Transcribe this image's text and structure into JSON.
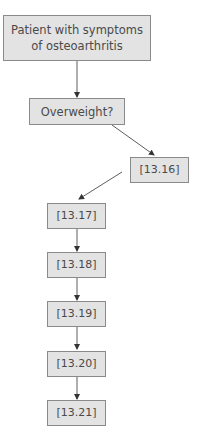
{
  "diagram": {
    "type": "flowchart",
    "colors": {
      "node_fill": "#e3e3e3",
      "node_border": "#8a8a8a",
      "text": "#4a4a4a",
      "edge": "#333333"
    },
    "nodes": [
      {
        "id": "n1",
        "label": "Patient with symptoms of osteoarthritis",
        "line1": "Patient with symptoms",
        "line2": "of osteoarthritis"
      },
      {
        "id": "n2",
        "label": "Overweight?"
      },
      {
        "id": "n3",
        "label": "[13.16]"
      },
      {
        "id": "n4",
        "label": "[13.17]"
      },
      {
        "id": "n5",
        "label": "[13.18]"
      },
      {
        "id": "n6",
        "label": "[13.19]"
      },
      {
        "id": "n7",
        "label": "[13.20]"
      },
      {
        "id": "n8",
        "label": "[13.21]"
      }
    ],
    "edges": [
      {
        "from": "n1",
        "to": "n2"
      },
      {
        "from": "n2",
        "to": "n3"
      },
      {
        "from": "n3",
        "to": "n4"
      },
      {
        "from": "n4",
        "to": "n5"
      },
      {
        "from": "n5",
        "to": "n6"
      },
      {
        "from": "n6",
        "to": "n7"
      },
      {
        "from": "n7",
        "to": "n8"
      }
    ]
  }
}
